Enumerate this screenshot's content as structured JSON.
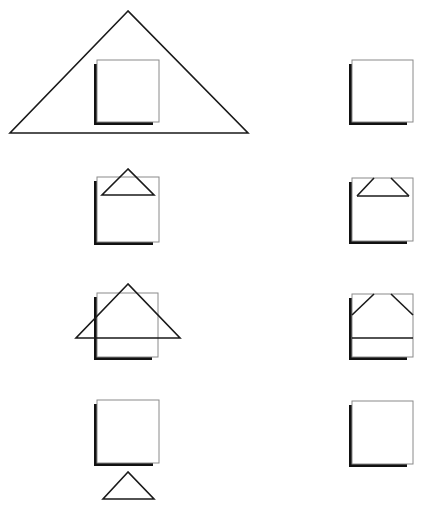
{
  "diagram": {
    "colors": {
      "stroke": "#1a1a1a",
      "window_border": "#8a8a8a",
      "shadow": "#111111",
      "background": "#ffffff"
    },
    "rows": [
      {
        "left": {
          "window": {
            "x": 97,
            "y": 60,
            "w": 62,
            "h": 62
          },
          "triangle": {
            "points": "128,11 10,133 248,133"
          }
        },
        "right": {
          "window": {
            "x": 352,
            "y": 60,
            "w": 61,
            "h": 62
          },
          "clipped_lines": []
        }
      },
      {
        "left": {
          "window": {
            "x": 97,
            "y": 177,
            "w": 62,
            "h": 65
          },
          "triangle": {
            "points": "128,169 102,195 154,195"
          }
        },
        "right": {
          "window": {
            "x": 352,
            "y": 178,
            "w": 61,
            "h": 63
          },
          "clipped_lines": [
            "374,178 357,196",
            "391,178 409,196",
            "357,196 409,196"
          ]
        }
      },
      {
        "left": {
          "window": {
            "x": 97,
            "y": 293,
            "w": 61,
            "h": 64
          },
          "triangle": {
            "points": "128,284 76,338 180,338"
          }
        },
        "right": {
          "window": {
            "x": 352,
            "y": 294,
            "w": 61,
            "h": 63
          },
          "clipped_lines": [
            "374,294 352,315",
            "391,294 413,315",
            "352,338 413,338"
          ]
        }
      },
      {
        "left": {
          "window": {
            "x": 97,
            "y": 400,
            "w": 62,
            "h": 63
          },
          "triangle": {
            "points": "128,472 103,499 154,499"
          }
        },
        "right": {
          "window": {
            "x": 352,
            "y": 401,
            "w": 61,
            "h": 63
          },
          "clipped_lines": []
        }
      }
    ]
  }
}
